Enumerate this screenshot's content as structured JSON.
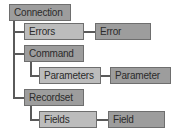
{
  "diagram": {
    "type": "tree",
    "palette": {
      "object_fill": "#9d9d9d",
      "collection_fill": "#bcbcbc",
      "border": "#6e6e6e",
      "connector": "#5a5a5a",
      "text": "#2b2b2b",
      "background": "#ffffff"
    },
    "nodes": {
      "connection": {
        "label": "Connection",
        "kind": "object"
      },
      "errors": {
        "label": "Errors",
        "kind": "collection"
      },
      "error": {
        "label": "Error",
        "kind": "object"
      },
      "command": {
        "label": "Command",
        "kind": "object"
      },
      "parameters": {
        "label": "Parameters",
        "kind": "collection"
      },
      "parameter": {
        "label": "Parameter",
        "kind": "object"
      },
      "recordset": {
        "label": "Recordset",
        "kind": "object"
      },
      "fields": {
        "label": "Fields",
        "kind": "collection"
      },
      "field": {
        "label": "Field",
        "kind": "object"
      }
    },
    "edges": [
      {
        "from": "connection",
        "to": "errors"
      },
      {
        "from": "errors",
        "to": "error"
      },
      {
        "from": "connection",
        "to": "command"
      },
      {
        "from": "command",
        "to": "parameters"
      },
      {
        "from": "parameters",
        "to": "parameter"
      },
      {
        "from": "connection",
        "to": "recordset"
      },
      {
        "from": "recordset",
        "to": "fields"
      },
      {
        "from": "fields",
        "to": "field"
      }
    ]
  }
}
